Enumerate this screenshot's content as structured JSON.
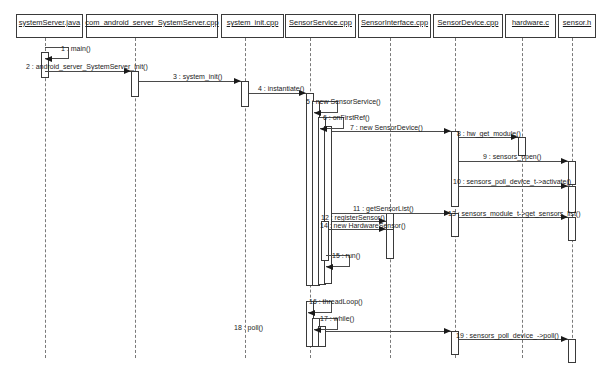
{
  "diagram": {
    "type": "uml-sequence-diagram",
    "colors": {
      "background": "#ffffff",
      "box_border": "#3a3a3a",
      "lifeline": "#7a7a7a",
      "message": "#4a4a4a",
      "text": "#1a1a1a"
    },
    "participants": [
      {
        "id": "systemserver_java",
        "label": "systemServer.java",
        "x": 16,
        "y": 14,
        "w": 67,
        "h": 24,
        "lifeline_x": 45
      },
      {
        "id": "com_android_server",
        "label": "com_android_server_SystemServer.cpp",
        "x": 86,
        "y": 14,
        "w": 132,
        "h": 24,
        "lifeline_x": 135
      },
      {
        "id": "system_init_cpp",
        "label": "system_init.cpp",
        "x": 221,
        "y": 14,
        "w": 63,
        "h": 24,
        "lifeline_x": 245
      },
      {
        "id": "sensorservice_cpp",
        "label": "SensorService.cpp",
        "x": 285,
        "y": 14,
        "w": 71,
        "h": 24,
        "lifeline_x": 310
      },
      {
        "id": "sensorinterface_cpp",
        "label": "SensorInterface.cpp",
        "x": 358,
        "y": 14,
        "w": 73,
        "h": 24,
        "lifeline_x": 390
      },
      {
        "id": "sensordevice_cpp",
        "label": "SensorDevice.cpp",
        "x": 433,
        "y": 14,
        "w": 70,
        "h": 24,
        "lifeline_x": 455
      },
      {
        "id": "hardware_c",
        "label": "hardware.c",
        "x": 505,
        "y": 14,
        "w": 51,
        "h": 24,
        "lifeline_x": 522
      },
      {
        "id": "sensor_h",
        "label": "sensor.h",
        "x": 558,
        "y": 14,
        "w": 38,
        "h": 24,
        "lifeline_x": 572
      }
    ],
    "lifeline_top": 38,
    "lifeline_bottom": 358,
    "activations": [
      {
        "id": "act-systemserver-main",
        "x": 41,
        "y": 52,
        "w": 8,
        "h": 26
      },
      {
        "id": "act-comandroid-init",
        "x": 131,
        "y": 71,
        "w": 8,
        "h": 26
      },
      {
        "id": "act-systeminit-instant",
        "x": 241,
        "y": 81,
        "w": 8,
        "h": 26
      },
      {
        "id": "act-sensorservice-outer",
        "x": 306,
        "y": 93,
        "w": 8,
        "h": 193
      },
      {
        "id": "act-sensorservice-new",
        "x": 312,
        "y": 101,
        "w": 8,
        "h": 185
      },
      {
        "id": "act-sensorservice-first",
        "x": 318,
        "y": 117,
        "w": 8,
        "h": 168
      },
      {
        "id": "act-sensorservice-reg",
        "x": 324,
        "y": 126,
        "w": 8,
        "h": 158
      },
      {
        "id": "act-sensorinterface-reg",
        "x": 386,
        "y": 213,
        "w": 8,
        "h": 20
      },
      {
        "id": "act-sensorinterface-new",
        "x": 321,
        "y": 221,
        "w": 8,
        "h": 40
      },
      {
        "id": "act-sensorinterface-hw",
        "x": 386,
        "y": 229,
        "w": 8,
        "h": 30
      },
      {
        "id": "act-sensordevice-new",
        "x": 451,
        "y": 131,
        "w": 8,
        "h": 76
      },
      {
        "id": "act-hardware-get",
        "x": 518,
        "y": 137,
        "w": 8,
        "h": 19
      },
      {
        "id": "act-sensorh-open",
        "x": 568,
        "y": 161,
        "w": 8,
        "h": 24
      },
      {
        "id": "act-sensorh-activate",
        "x": 568,
        "y": 186,
        "w": 8,
        "h": 27
      },
      {
        "id": "act-sensordevice-list",
        "x": 451,
        "y": 213,
        "w": 8,
        "h": 24
      },
      {
        "id": "act-sensorh-list",
        "x": 568,
        "y": 217,
        "w": 8,
        "h": 24
      },
      {
        "id": "act-sensorservice-loop",
        "x": 306,
        "y": 301,
        "w": 8,
        "h": 46
      },
      {
        "id": "act-sensorservice-while",
        "x": 312,
        "y": 318,
        "w": 8,
        "h": 29
      },
      {
        "id": "act-sensorservice-poll",
        "x": 318,
        "y": 326,
        "w": 8,
        "h": 21
      },
      {
        "id": "act-sensordevice-poll",
        "x": 451,
        "y": 331,
        "w": 8,
        "h": 24
      },
      {
        "id": "act-sensorh-poll",
        "x": 568,
        "y": 339,
        "w": 8,
        "h": 24
      }
    ],
    "messages": [
      {
        "num": "1",
        "label": "1 : main()",
        "kind": "self",
        "from": "systemserver_java",
        "to": "systemserver_java",
        "x": 45,
        "y": 47,
        "w": 24,
        "h": 12,
        "label_x": 61,
        "label_y": 45
      },
      {
        "num": "2",
        "label": "2 : android_server_SystemServer_init()",
        "kind": "call",
        "from": "systemserver_java",
        "to": "com_android_server",
        "x1": 45,
        "x2": 131,
        "y": 71,
        "label_x": 26,
        "label_y": 63
      },
      {
        "num": "3",
        "label": "3 : system_init()",
        "kind": "call",
        "from": "com_android_server",
        "to": "system_init_cpp",
        "x1": 139,
        "x2": 241,
        "y": 81,
        "label_x": 173,
        "label_y": 73
      },
      {
        "num": "4",
        "label": "4 : instantiate()",
        "kind": "call",
        "from": "system_init_cpp",
        "to": "sensorservice_cpp",
        "x1": 249,
        "x2": 306,
        "y": 93,
        "label_x": 258,
        "label_y": 85
      },
      {
        "num": "5",
        "label": "5 : new SensorService()",
        "kind": "self",
        "from": "sensorservice_cpp",
        "to": "sensorservice_cpp",
        "x": 314,
        "y": 101,
        "w": 24,
        "h": 12,
        "label_x": 306,
        "label_y": 98
      },
      {
        "num": "6",
        "label": "6 : onFirstRef()",
        "kind": "self",
        "from": "sensorservice_cpp",
        "to": "sensorservice_cpp",
        "x": 320,
        "y": 117,
        "w": 24,
        "h": 12,
        "label_x": 323,
        "label_y": 114
      },
      {
        "num": "7",
        "label": "7 : new SensorDevice()",
        "kind": "call",
        "from": "sensorservice_cpp",
        "to": "sensordevice_cpp",
        "x1": 332,
        "x2": 451,
        "y": 131,
        "label_x": 350,
        "label_y": 124
      },
      {
        "num": "8",
        "label": "8 : hw_get_module()",
        "kind": "call",
        "from": "sensordevice_cpp",
        "to": "hardware_c",
        "x1": 459,
        "x2": 518,
        "y": 137,
        "label_x": 457,
        "label_y": 130
      },
      {
        "num": "9",
        "label": "9 : sensors_open()",
        "kind": "call",
        "from": "sensordevice_cpp",
        "to": "sensor_h",
        "x1": 459,
        "x2": 568,
        "y": 161,
        "label_x": 483,
        "label_y": 153
      },
      {
        "num": "10",
        "label": "10 : sensors_poll_device_t->activate()",
        "kind": "call",
        "from": "sensordevice_cpp",
        "to": "sensor_h",
        "x1": 459,
        "x2": 568,
        "y": 186,
        "label_x": 453,
        "label_y": 178
      },
      {
        "num": "11",
        "label": "11 : getSensorList()",
        "kind": "call",
        "from": "sensorservice_cpp",
        "to": "sensordevice_cpp",
        "x1": 332,
        "x2": 451,
        "y": 213,
        "label_x": 353,
        "label_y": 205
      },
      {
        "num": "12",
        "label": "12 : registerSensor()",
        "kind": "call",
        "from": "sensorservice_cpp",
        "to": "sensorinterface_cpp",
        "x1": 332,
        "x2": 386,
        "y": 221,
        "label_x": 321,
        "label_y": 214
      },
      {
        "num": "13",
        "label": "13 : sensors_module_t->get_sensors_list()",
        "kind": "call",
        "from": "sensordevice_cpp",
        "to": "sensor_h",
        "x1": 459,
        "x2": 568,
        "y": 217,
        "label_x": 448,
        "label_y": 210
      },
      {
        "num": "14",
        "label": "14 : new HardwareSensor()",
        "kind": "call",
        "from": "sensorinterface_cpp",
        "to": "sensorinterface_cpp",
        "x1": 329,
        "x2": 386,
        "y": 229,
        "label_x": 320,
        "label_y": 222
      },
      {
        "num": "15",
        "label": "15 : run()",
        "kind": "self",
        "from": "sensorservice_cpp",
        "to": "sensorservice_cpp",
        "x": 326,
        "y": 255,
        "w": 24,
        "h": 12,
        "label_x": 332,
        "label_y": 252
      },
      {
        "num": "16",
        "label": "16 : threadLoop()",
        "kind": "self",
        "from": "sensorservice_cpp",
        "to": "sensorservice_cpp",
        "x": 308,
        "y": 301,
        "w": 24,
        "h": 12,
        "label_x": 309,
        "label_y": 298
      },
      {
        "num": "17",
        "label": "17 : while()",
        "kind": "self",
        "from": "sensorservice_cpp",
        "to": "sensorservice_cpp",
        "x": 314,
        "y": 318,
        "w": 24,
        "h": 12,
        "label_x": 320,
        "label_y": 315
      },
      {
        "num": "18",
        "label": "18 : poll()",
        "kind": "call",
        "from": "sensorservice_cpp",
        "to": "sensordevice_cpp",
        "x1": 326,
        "x2": 451,
        "y": 331,
        "label_x": 234,
        "label_y": 324
      },
      {
        "num": "19",
        "label": "19 : sensors_poll_device_->poll()",
        "kind": "call",
        "from": "sensordevice_cpp",
        "to": "sensor_h",
        "x1": 459,
        "x2": 568,
        "y": 339,
        "label_x": 456,
        "label_y": 332
      }
    ]
  }
}
